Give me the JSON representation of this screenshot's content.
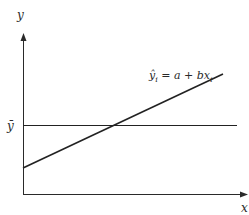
{
  "diagram": {
    "type": "regression-line-diagram",
    "axes": {
      "x_label": "x",
      "y_label": "y"
    },
    "mean_line": {
      "label": "ȳ",
      "description": "horizontal line at mean of y"
    },
    "regression_line": {
      "label_yhat": "ŷ",
      "label_sub": "i",
      "label_eq": " = a + bx",
      "label_sub2": "i",
      "description": "fitted line crossing mean line"
    }
  },
  "colors": {
    "line": "#222222",
    "background": "#ffffff"
  }
}
